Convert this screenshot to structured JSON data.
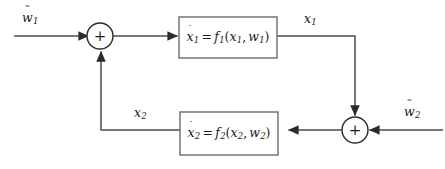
{
  "diagram": {
    "type": "control-system-block-diagram",
    "width": 445,
    "height": 169,
    "background_color": "#ffffff",
    "line_color": "#4d4d4d",
    "block_border_color": "#6b6b6b",
    "text_color": "#1a1a1a",
    "blocks": [
      {
        "id": "subsystem-1",
        "equation_text": "ẋ1 = f1(x1, w1)",
        "state_symbol": "x",
        "state_subscript": "1",
        "function_symbol": "f",
        "function_subscript": "1",
        "arg_state": "x",
        "arg_state_subscript": "1",
        "arg_input": "w",
        "arg_input_subscript": "1",
        "equals": "=",
        "open_paren": "(",
        "close_paren": ")",
        "comma": ","
      },
      {
        "id": "subsystem-2",
        "equation_text": "ẋ2 = f2(x2, w2)",
        "state_symbol": "x",
        "state_subscript": "2",
        "function_symbol": "f",
        "function_subscript": "2",
        "arg_state": "x",
        "arg_state_subscript": "2",
        "arg_input": "w",
        "arg_input_subscript": "2",
        "equals": "=",
        "open_paren": "(",
        "close_paren": ")",
        "comma": ","
      }
    ],
    "summing_junctions": [
      {
        "id": "summing-junction-left",
        "sign": "+",
        "cx": 100,
        "cy": 36,
        "r": 13
      },
      {
        "id": "summing-junction-right",
        "sign": "+",
        "cx": 355,
        "cy": 130,
        "r": 13
      }
    ],
    "signals": [
      {
        "id": "external-input-1",
        "symbol": "w",
        "accent": "tilde",
        "accent_glyph": "˜",
        "subscript": "1",
        "text": "wϜ1"
      },
      {
        "id": "state-output-1",
        "symbol": "x",
        "accent": "none",
        "accent_glyph": "",
        "subscript": "1",
        "text": "x1"
      },
      {
        "id": "state-output-2",
        "symbol": "x",
        "accent": "none",
        "accent_glyph": "",
        "subscript": "2",
        "text": "x2"
      },
      {
        "id": "external-input-2",
        "symbol": "w",
        "accent": "tilde",
        "accent_glyph": "˜",
        "subscript": "2",
        "text": "wϜ2"
      }
    ],
    "dot_accent_glyph": "˙"
  }
}
